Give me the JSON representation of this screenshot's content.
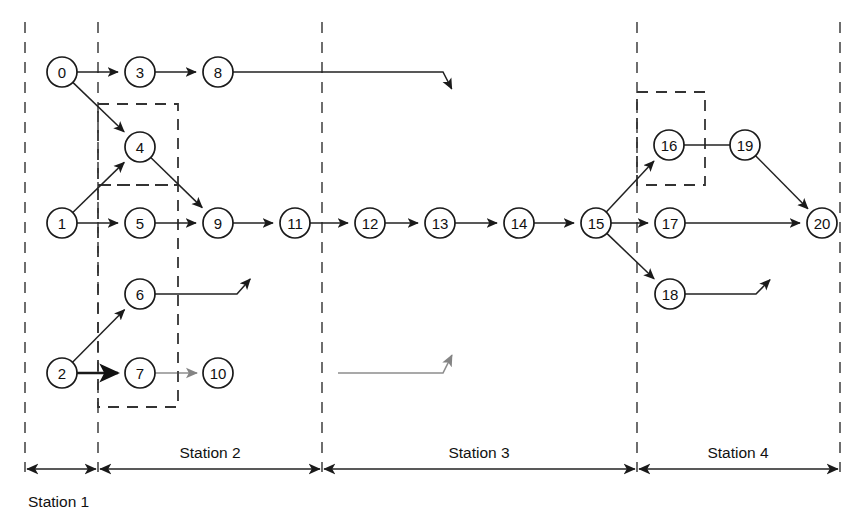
{
  "figure": {
    "kind": "precedence-graph",
    "background_color": "#ffffff",
    "line_color": "#222222",
    "node_fill": "#ffffff",
    "node_stroke": "#1a1a1a",
    "dashed_color": "#555555",
    "width": 861,
    "height": 527
  },
  "nodes": [
    {
      "id": "0",
      "label": "0",
      "cx": 62,
      "cy": 72,
      "r": 15
    },
    {
      "id": "1",
      "label": "1",
      "cx": 62,
      "cy": 223,
      "r": 15
    },
    {
      "id": "2",
      "label": "2",
      "cx": 62,
      "cy": 373,
      "r": 15
    },
    {
      "id": "3",
      "label": "3",
      "cx": 140,
      "cy": 72,
      "r": 15
    },
    {
      "id": "4",
      "label": "4",
      "cx": 140,
      "cy": 147,
      "r": 15
    },
    {
      "id": "5",
      "label": "5",
      "cx": 140,
      "cy": 223,
      "r": 15
    },
    {
      "id": "6",
      "label": "6",
      "cx": 140,
      "cy": 294,
      "r": 15
    },
    {
      "id": "7",
      "label": "7",
      "cx": 140,
      "cy": 373,
      "r": 15
    },
    {
      "id": "8",
      "label": "8",
      "cx": 218,
      "cy": 72,
      "r": 15
    },
    {
      "id": "9",
      "label": "9",
      "cx": 218,
      "cy": 223,
      "r": 15
    },
    {
      "id": "10",
      "label": "10",
      "cx": 218,
      "cy": 373,
      "r": 15
    },
    {
      "id": "11",
      "label": "11",
      "cx": 295,
      "cy": 223,
      "r": 15
    },
    {
      "id": "12",
      "label": "12",
      "cx": 370,
      "cy": 223,
      "r": 15
    },
    {
      "id": "13",
      "label": "13",
      "cx": 440,
      "cy": 223,
      "r": 15
    },
    {
      "id": "14",
      "label": "14",
      "cx": 519,
      "cy": 223,
      "r": 15
    },
    {
      "id": "15",
      "label": "15",
      "cx": 596,
      "cy": 223,
      "r": 15
    },
    {
      "id": "16",
      "label": "16",
      "cx": 669,
      "cy": 145,
      "r": 15
    },
    {
      "id": "17",
      "label": "17",
      "cx": 670,
      "cy": 223,
      "r": 15
    },
    {
      "id": "18",
      "label": "18",
      "cx": 670,
      "cy": 294,
      "r": 15
    },
    {
      "id": "19",
      "label": "19",
      "cx": 745,
      "cy": 145,
      "r": 15
    },
    {
      "id": "20",
      "label": "20",
      "cx": 822,
      "cy": 223,
      "r": 15
    }
  ],
  "edges": [
    {
      "from": "0",
      "to": "3",
      "style": "normal",
      "arrow": true
    },
    {
      "from": "0",
      "to": "4",
      "style": "normal",
      "arrow": true
    },
    {
      "from": "3",
      "to": "8",
      "style": "normal",
      "arrow": true
    },
    {
      "from": "1",
      "to": "4",
      "style": "normal",
      "arrow": true
    },
    {
      "from": "1",
      "to": "5",
      "style": "normal",
      "arrow": true
    },
    {
      "from": "4",
      "to": "9",
      "style": "normal",
      "arrow": true
    },
    {
      "from": "5",
      "to": "9",
      "style": "normal",
      "arrow": true
    },
    {
      "from": "2",
      "to": "6",
      "style": "normal",
      "arrow": true
    },
    {
      "from": "2",
      "to": "7",
      "style": "bold",
      "arrow": true
    },
    {
      "from": "7",
      "to": "10",
      "style": "faint",
      "arrow": true
    },
    {
      "from": "9",
      "to": "11",
      "style": "normal",
      "arrow": true
    },
    {
      "from": "6",
      "to": "11",
      "style": "normal",
      "arrow": true
    },
    {
      "from": "11",
      "to": "12",
      "style": "normal",
      "arrow": true
    },
    {
      "from": "12",
      "to": "13",
      "style": "normal",
      "arrow": true
    },
    {
      "from": "13",
      "to": "14",
      "style": "normal",
      "arrow": true
    },
    {
      "from": "8",
      "to": "14",
      "style": "normal",
      "arrow": true
    },
    {
      "from": "10",
      "to": "14",
      "style": "faint",
      "arrow": true
    },
    {
      "from": "14",
      "to": "15",
      "style": "normal",
      "arrow": true
    },
    {
      "from": "15",
      "to": "16",
      "style": "normal",
      "arrow": true
    },
    {
      "from": "15",
      "to": "17",
      "style": "normal",
      "arrow": true
    },
    {
      "from": "15",
      "to": "18",
      "style": "normal",
      "arrow": true
    },
    {
      "from": "16",
      "to": "19",
      "style": "normal",
      "arrow": false
    },
    {
      "from": "19",
      "to": "20",
      "style": "normal",
      "arrow": true
    },
    {
      "from": "17",
      "to": "20",
      "style": "normal",
      "arrow": true
    },
    {
      "from": "18",
      "to": "20",
      "style": "normal",
      "arrow": true
    }
  ],
  "dividers": [
    {
      "id": "div-0",
      "x": 25,
      "y1": 22,
      "y2": 472
    },
    {
      "id": "div-1",
      "x": 98,
      "y1": 22,
      "y2": 472
    },
    {
      "id": "div-2",
      "x": 322,
      "y1": 22,
      "y2": 472
    },
    {
      "id": "div-3",
      "x": 637,
      "y1": 22,
      "y2": 472
    },
    {
      "id": "div-4",
      "x": 840,
      "y1": 22,
      "y2": 472
    }
  ],
  "group_boxes": [
    {
      "id": "box-upper",
      "x": 98,
      "y": 104,
      "width": 80,
      "height": 81
    },
    {
      "id": "box-lower",
      "x": 98,
      "y": 185,
      "width": 80,
      "height": 222
    },
    {
      "id": "box-right",
      "x": 637,
      "y": 92,
      "width": 68,
      "height": 93
    }
  ],
  "stations": [
    {
      "id": "station-1",
      "label": "Station 1",
      "x1": 25,
      "x2": 98,
      "label_x": 28,
      "label_y": 507,
      "label_align": "left"
    },
    {
      "id": "station-2",
      "label": "Station 2",
      "x1": 98,
      "x2": 322,
      "label_x": 210,
      "label_y": 458,
      "label_align": "center"
    },
    {
      "id": "station-3",
      "label": "Station 3",
      "x1": 322,
      "x2": 637,
      "label_x": 479,
      "label_y": 458,
      "label_align": "center"
    },
    {
      "id": "station-4",
      "label": "Station 4",
      "x1": 637,
      "x2": 840,
      "label_x": 738,
      "label_y": 458,
      "label_align": "center"
    }
  ],
  "station_axis": {
    "y": 469
  }
}
